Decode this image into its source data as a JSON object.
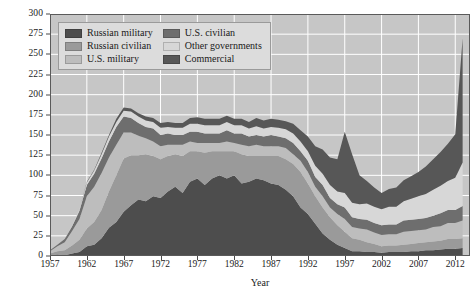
{
  "chart_data": {
    "type": "area",
    "title": "",
    "subtitle": "",
    "xlabel": "Year",
    "ylabel": "Number of spacecraft",
    "xlim": [
      1957,
      2014
    ],
    "ylim": [
      0,
      300
    ],
    "grid": true,
    "legend_position": "top-left",
    "stacked": true,
    "x_tick_labels": [
      "1957",
      "1962",
      "1967",
      "1972",
      "1977",
      "1982",
      "1987",
      "1992",
      "1997",
      "2002",
      "2007",
      "2012"
    ],
    "x_tick_values": [
      1957,
      1962,
      1967,
      1972,
      1977,
      1982,
      1987,
      1992,
      1997,
      2002,
      2007,
      2012
    ],
    "y_tick_labels": [
      "0",
      "25",
      "50",
      "75",
      "100",
      "125",
      "150",
      "175",
      "200",
      "225",
      "250",
      "275",
      "300"
    ],
    "y_tick_values": [
      0,
      25,
      50,
      75,
      100,
      125,
      150,
      175,
      200,
      225,
      250,
      275,
      300
    ],
    "x": [
      1957,
      1958,
      1959,
      1960,
      1961,
      1962,
      1963,
      1964,
      1965,
      1966,
      1967,
      1968,
      1969,
      1970,
      1971,
      1972,
      1973,
      1974,
      1975,
      1976,
      1977,
      1978,
      1979,
      1980,
      1981,
      1982,
      1983,
      1984,
      1985,
      1986,
      1987,
      1988,
      1989,
      1990,
      1991,
      1992,
      1993,
      1994,
      1995,
      1996,
      1997,
      1998,
      1999,
      2000,
      2001,
      2002,
      2003,
      2004,
      2005,
      2006,
      2007,
      2008,
      2009,
      2010,
      2011,
      2012,
      2013
    ],
    "series": [
      {
        "name": "Russian military",
        "color": "#4d4d4d",
        "values": [
          1,
          2,
          1,
          3,
          5,
          12,
          14,
          22,
          35,
          42,
          55,
          63,
          70,
          68,
          74,
          72,
          80,
          86,
          78,
          92,
          96,
          88,
          96,
          100,
          96,
          100,
          90,
          92,
          96,
          94,
          90,
          88,
          82,
          74,
          60,
          52,
          40,
          28,
          20,
          14,
          10,
          6,
          6,
          5,
          5,
          4,
          5,
          5,
          5,
          6,
          6,
          7,
          7,
          8,
          9,
          9,
          10
        ]
      },
      {
        "name": "Russian civilian",
        "color": "#9a9a9a",
        "values": [
          2,
          4,
          6,
          10,
          15,
          22,
          28,
          35,
          45,
          58,
          66,
          62,
          55,
          58,
          50,
          48,
          44,
          40,
          46,
          38,
          34,
          40,
          34,
          30,
          34,
          30,
          36,
          32,
          28,
          30,
          34,
          36,
          38,
          40,
          44,
          38,
          34,
          32,
          28,
          24,
          20,
          16,
          14,
          12,
          10,
          8,
          8,
          8,
          9,
          9,
          10,
          10,
          11,
          11,
          12,
          12,
          12
        ]
      },
      {
        "name": "U.S. military",
        "color": "#bdbdbd",
        "values": [
          3,
          6,
          10,
          18,
          26,
          40,
          44,
          46,
          42,
          38,
          32,
          28,
          24,
          20,
          18,
          16,
          14,
          12,
          14,
          12,
          10,
          12,
          10,
          10,
          12,
          10,
          12,
          12,
          14,
          12,
          12,
          12,
          14,
          12,
          14,
          14,
          12,
          14,
          12,
          14,
          16,
          14,
          14,
          16,
          14,
          14,
          14,
          14,
          16,
          16,
          16,
          16,
          18,
          18,
          20,
          20,
          22
        ]
      },
      {
        "name": "U.S. civilian",
        "color": "#6e6e6e",
        "values": [
          1,
          2,
          4,
          6,
          10,
          14,
          16,
          18,
          20,
          22,
          20,
          18,
          16,
          14,
          16,
          14,
          14,
          12,
          12,
          12,
          14,
          12,
          12,
          12,
          14,
          12,
          14,
          12,
          12,
          12,
          14,
          12,
          12,
          14,
          12,
          14,
          12,
          14,
          12,
          12,
          14,
          12,
          12,
          12,
          12,
          12,
          12,
          12,
          14,
          14,
          14,
          14,
          14,
          16,
          16,
          16,
          18
        ]
      },
      {
        "name": "Other governments",
        "color": "#d7d7d7",
        "values": [
          0,
          0,
          0,
          1,
          2,
          3,
          4,
          5,
          6,
          6,
          7,
          8,
          8,
          8,
          8,
          9,
          8,
          9,
          9,
          10,
          10,
          10,
          10,
          10,
          10,
          10,
          10,
          10,
          11,
          10,
          10,
          11,
          11,
          12,
          12,
          12,
          14,
          14,
          16,
          16,
          18,
          18,
          18,
          20,
          20,
          20,
          22,
          22,
          24,
          26,
          28,
          30,
          32,
          34,
          36,
          40,
          54
        ]
      },
      {
        "name": "Commercial",
        "color": "#575757",
        "values": [
          0,
          0,
          0,
          0,
          0,
          1,
          1,
          2,
          2,
          4,
          4,
          4,
          4,
          5,
          5,
          6,
          6,
          6,
          6,
          7,
          8,
          8,
          8,
          8,
          8,
          8,
          8,
          8,
          10,
          10,
          10,
          10,
          10,
          12,
          14,
          18,
          24,
          30,
          34,
          40,
          76,
          60,
          36,
          28,
          24,
          20,
          22,
          24,
          26,
          28,
          30,
          34,
          38,
          42,
          46,
          54,
          154
        ]
      }
    ]
  },
  "legend": {
    "items": [
      {
        "label": "Russian military",
        "color": "#4d4d4d"
      },
      {
        "label": "U.S. civilian",
        "color": "#6e6e6e"
      },
      {
        "label": "Russian civilian",
        "color": "#9a9a9a"
      },
      {
        "label": "Other governments",
        "color": "#d7d7d7"
      },
      {
        "label": "U.S. military",
        "color": "#bdbdbd"
      },
      {
        "label": "Commercial",
        "color": "#575757"
      }
    ]
  },
  "style": {
    "plot_background": "#c6c6c6",
    "gridline_color": "#ffffff",
    "axis_color": "#5a5a5a",
    "page_background": "#ffffff",
    "legend_background": "#dcdcdc",
    "legend_border": "#9a9a9a"
  }
}
